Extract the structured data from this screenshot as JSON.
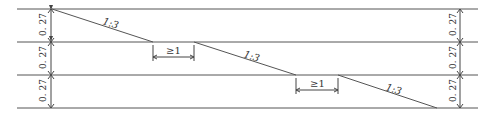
{
  "diagram": {
    "type": "stepped-slope-section",
    "layers": [
      {
        "thickness_label": "0. 27"
      },
      {
        "thickness_label": "0. 27"
      },
      {
        "thickness_label": "0. 27"
      }
    ],
    "slopes": [
      {
        "label": "1:3"
      },
      {
        "label": "1:3"
      },
      {
        "label": "1:3"
      }
    ],
    "setbacks": [
      {
        "label": "≥1"
      },
      {
        "label": "≥1"
      }
    ],
    "colors": {
      "line": "#555555",
      "text": "#333333"
    }
  },
  "labels": {
    "left_dim_1": "0. 27",
    "left_dim_2": "0. 27",
    "left_dim_3": "0. 27",
    "right_dim_1": "0. 27",
    "right_dim_2": "0. 27",
    "right_dim_3": "0. 27",
    "slope_1": "1:3",
    "slope_2": "1:3",
    "slope_3": "1:3",
    "setback_1": "≥1",
    "setback_2": "≥1"
  }
}
